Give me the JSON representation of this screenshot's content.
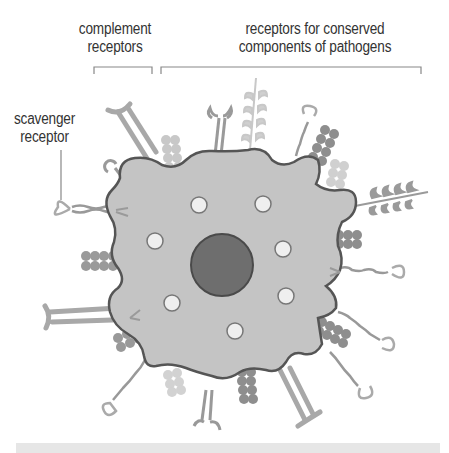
{
  "diagram": {
    "labels": {
      "complement_receptors": [
        "complement",
        "receptors"
      ],
      "conserved_components": [
        "receptors for conserved",
        "components of pathogens"
      ],
      "scavenger_receptor": [
        "scavenger",
        "receptor"
      ]
    },
    "colors": {
      "cell_fill": "#c4c4c4",
      "cell_outline": "#555555",
      "nucleus": "#6e6e6e",
      "vesicle": "#efefef",
      "receptor_dark": "#8e8e8e",
      "receptor_light": "#bdbdbd",
      "receptor_pale": "#d8d8d8",
      "label_text": "#333333",
      "bracket": "#888888",
      "footer_bar": "#e6e6e6"
    }
  }
}
